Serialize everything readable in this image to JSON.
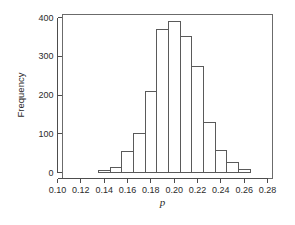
{
  "chart_data": {
    "type": "bar",
    "title": "",
    "subtitle": "",
    "xlabel": "p",
    "ylabel": "Frequency",
    "xlim": [
      0.1,
      0.28
    ],
    "ylim": [
      0,
      400
    ],
    "grid": false,
    "legend": null,
    "bin_width": 0.01,
    "x_tick_labels": [
      "0.10",
      "0.12",
      "0.14",
      "0.16",
      "0.18",
      "0.20",
      "0.22",
      "0.24",
      "0.26",
      "0.28"
    ],
    "x_tick_values": [
      0.1,
      0.12,
      0.14,
      0.16,
      0.18,
      0.2,
      0.22,
      0.24,
      0.26,
      0.28
    ],
    "y_tick_labels": [
      "0",
      "100",
      "200",
      "300",
      "400"
    ],
    "y_tick_values": [
      0,
      100,
      200,
      300,
      400
    ],
    "bins": [
      {
        "start": 0.135,
        "end": 0.145,
        "value": 5
      },
      {
        "start": 0.145,
        "end": 0.155,
        "value": 14
      },
      {
        "start": 0.155,
        "end": 0.165,
        "value": 53
      },
      {
        "start": 0.165,
        "end": 0.175,
        "value": 100
      },
      {
        "start": 0.175,
        "end": 0.185,
        "value": 208
      },
      {
        "start": 0.185,
        "end": 0.195,
        "value": 368
      },
      {
        "start": 0.195,
        "end": 0.205,
        "value": 390
      },
      {
        "start": 0.205,
        "end": 0.215,
        "value": 350
      },
      {
        "start": 0.215,
        "end": 0.225,
        "value": 273
      },
      {
        "start": 0.225,
        "end": 0.235,
        "value": 128
      },
      {
        "start": 0.235,
        "end": 0.245,
        "value": 58
      },
      {
        "start": 0.245,
        "end": 0.255,
        "value": 25
      },
      {
        "start": 0.255,
        "end": 0.265,
        "value": 8
      }
    ],
    "categories": [
      "0.135-0.145",
      "0.145-0.155",
      "0.155-0.165",
      "0.165-0.175",
      "0.175-0.185",
      "0.185-0.195",
      "0.195-0.205",
      "0.205-0.215",
      "0.215-0.225",
      "0.225-0.235",
      "0.235-0.245",
      "0.245-0.255",
      "0.255-0.265"
    ],
    "values": [
      5,
      14,
      53,
      100,
      208,
      368,
      390,
      350,
      273,
      128,
      58,
      25,
      8
    ],
    "colors": {
      "bar_fill": "#ffffff",
      "bar_stroke": "#5a5a5a",
      "axis": "#4d4d4d",
      "frame": "#6b6b6b",
      "text": "#2b2b2b",
      "background": "#ffffff"
    }
  }
}
